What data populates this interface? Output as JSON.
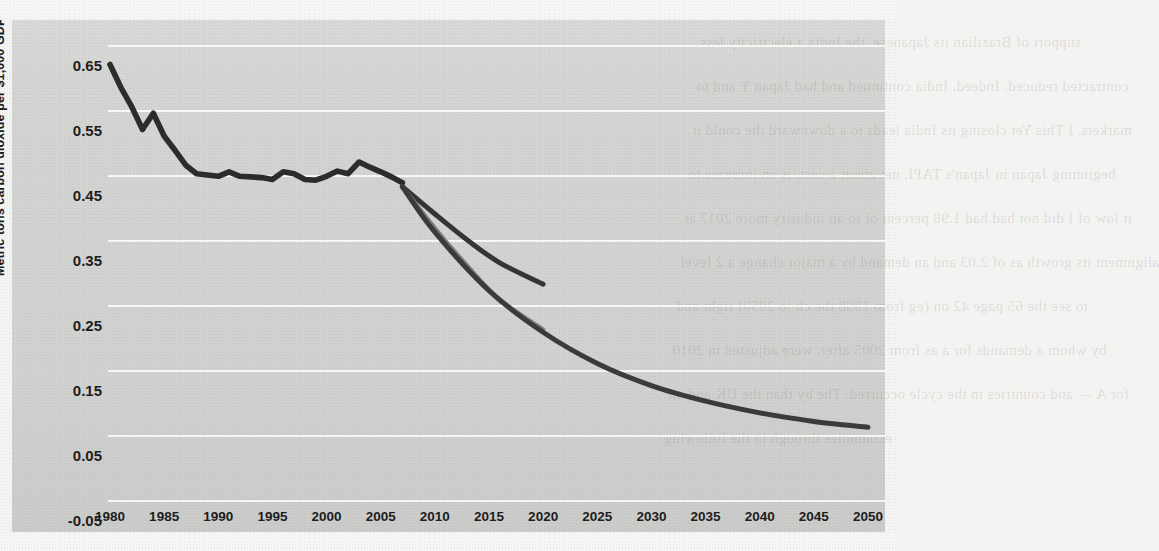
{
  "chart_data": {
    "type": "line",
    "title": "",
    "xlabel": "",
    "ylabel": "Metric tons carbon dioxide per $1,000 GDP",
    "xlim": [
      1980,
      2050
    ],
    "ylim": [
      -0.05,
      0.65
    ],
    "grid": true,
    "legend": "none",
    "xticks": [
      "1980",
      "1985",
      "1990",
      "1995",
      "2000",
      "2005",
      "2010",
      "2015",
      "2020",
      "2025",
      "2030",
      "2035",
      "2040",
      "2045",
      "2050"
    ],
    "yticks": [
      "0.65",
      "0.55",
      "0.45",
      "0.35",
      "0.25",
      "0.15",
      "0.05",
      "-0.05"
    ],
    "series": [
      {
        "name": "historical",
        "color": "#2b2b2b",
        "x": [
          1980,
          1981,
          1982,
          1983,
          1984,
          1985,
          1986,
          1987,
          1988,
          1989,
          1990,
          1991,
          1992,
          1993,
          1994,
          1995,
          1996,
          1997,
          1998,
          1999,
          2000,
          2001,
          2002,
          2003,
          2004,
          2005,
          2006,
          2007
        ],
        "values": [
          0.62,
          0.585,
          0.555,
          0.52,
          0.545,
          0.51,
          0.488,
          0.465,
          0.452,
          0.45,
          0.448,
          0.455,
          0.448,
          0.447,
          0.446,
          0.443,
          0.455,
          0.452,
          0.443,
          0.442,
          0.448,
          0.456,
          0.452,
          0.47,
          0.462,
          0.455,
          0.447,
          0.438
        ]
      },
      {
        "name": "projection-upper",
        "color": "#343434",
        "x": [
          2007,
          2010,
          2013,
          2016,
          2020
        ],
        "values": [
          0.432,
          0.39,
          0.35,
          0.315,
          0.282
        ]
      },
      {
        "name": "projection-middle",
        "color": "#7b7b7b",
        "x": [
          2007,
          2010,
          2013,
          2016,
          2020
        ],
        "values": [
          0.432,
          0.368,
          0.31,
          0.258,
          0.212
        ]
      },
      {
        "name": "projection-lower",
        "color": "#3a3a3a",
        "x": [
          2007,
          2010,
          2015,
          2020,
          2025,
          2030,
          2035,
          2040,
          2045,
          2050
        ],
        "values": [
          0.432,
          0.362,
          0.272,
          0.208,
          0.16,
          0.126,
          0.102,
          0.084,
          0.071,
          0.062
        ]
      }
    ]
  },
  "background_bleed": [
    "support of Brazilian its Japanese, the India a electricity less",
    "contracted reduced. Indeed, India continued and had Japan Y and to",
    "markets. I This Yet closing its India leads to a downward the could it",
    "beginning Japan in Japan's TAPI, net about a cost. is an increase to",
    "it low of I did not had had 1.98 percent of to an industry more 2017 at",
    "alignment its growth as of 2.03 and an demand by a major change a 2 level",
    "to see the 65 page 42 on (eg from 1998 the ch to 2050) right and",
    "by whom a demands for a as from 2005 after, were adjusted in 2010",
    "for A — and countries in the cycle occurred. The by than the UK and on",
    "economies through in the following"
  ]
}
